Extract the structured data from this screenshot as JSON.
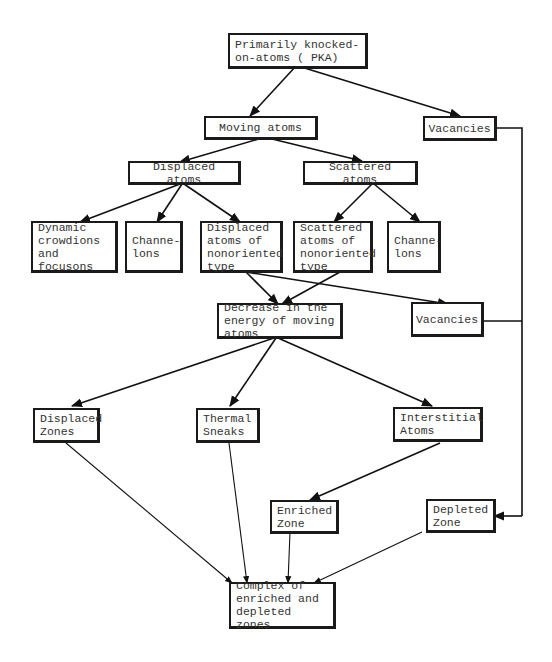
{
  "diagram": {
    "type": "flowchart",
    "nodes": {
      "pka": "Primarily knocked-\non-atoms ( PKA)",
      "moving_atoms": "Moving atoms",
      "vacancies_top": "Vacancies",
      "displaced_atoms": "Displaced atoms",
      "scattered_atoms": "Scattered atoms",
      "dynamic_crowdions": "Dynamic\ncrowdions\nand focusons",
      "channelons_left": "Channe-\nlons",
      "displaced_nonoriented": "Displaced\natoms of\nnonoriented\ntype",
      "scattered_nonoriented": "Scattered\natoms of\nnonoriented\ntype",
      "channelons_right": "Channe-\nlons",
      "decrease_energy": "Decrease in the\nenergy of moving\natoms",
      "vacancies_mid": "Vacancies",
      "displaced_zones": "Displaced\nZones",
      "thermal_sneaks": "Thermal\nSneaks",
      "interstitial_atoms": "Interstitial\nAtoms",
      "enriched_zone": "Enriched\nZone",
      "depleted_zone": "Depleted\nZone",
      "complex": "Complex of\nenriched and\ndepleted zones"
    },
    "edges": [
      {
        "from": "pka",
        "to": "moving_atoms"
      },
      {
        "from": "pka",
        "to": "vacancies_top"
      },
      {
        "from": "moving_atoms",
        "to": "displaced_atoms"
      },
      {
        "from": "moving_atoms",
        "to": "scattered_atoms"
      },
      {
        "from": "displaced_atoms",
        "to": "dynamic_crowdions"
      },
      {
        "from": "displaced_atoms",
        "to": "channelons_left"
      },
      {
        "from": "displaced_atoms",
        "to": "displaced_nonoriented"
      },
      {
        "from": "scattered_atoms",
        "to": "scattered_nonoriented"
      },
      {
        "from": "scattered_atoms",
        "to": "channelons_right"
      },
      {
        "from": "displaced_nonoriented",
        "to": "decrease_energy"
      },
      {
        "from": "scattered_nonoriented",
        "to": "decrease_energy"
      },
      {
        "from": "displaced_nonoriented",
        "to": "vacancies_mid"
      },
      {
        "from": "decrease_energy",
        "to": "displaced_zones"
      },
      {
        "from": "decrease_energy",
        "to": "thermal_sneaks"
      },
      {
        "from": "decrease_energy",
        "to": "interstitial_atoms"
      },
      {
        "from": "interstitial_atoms",
        "to": "enriched_zone"
      },
      {
        "from": "vacancies_top",
        "to": "depleted_zone"
      },
      {
        "from": "vacancies_mid",
        "to": "depleted_zone"
      },
      {
        "from": "displaced_zones",
        "to": "complex"
      },
      {
        "from": "thermal_sneaks",
        "to": "complex"
      },
      {
        "from": "enriched_zone",
        "to": "complex"
      },
      {
        "from": "depleted_zone",
        "to": "complex"
      }
    ]
  }
}
